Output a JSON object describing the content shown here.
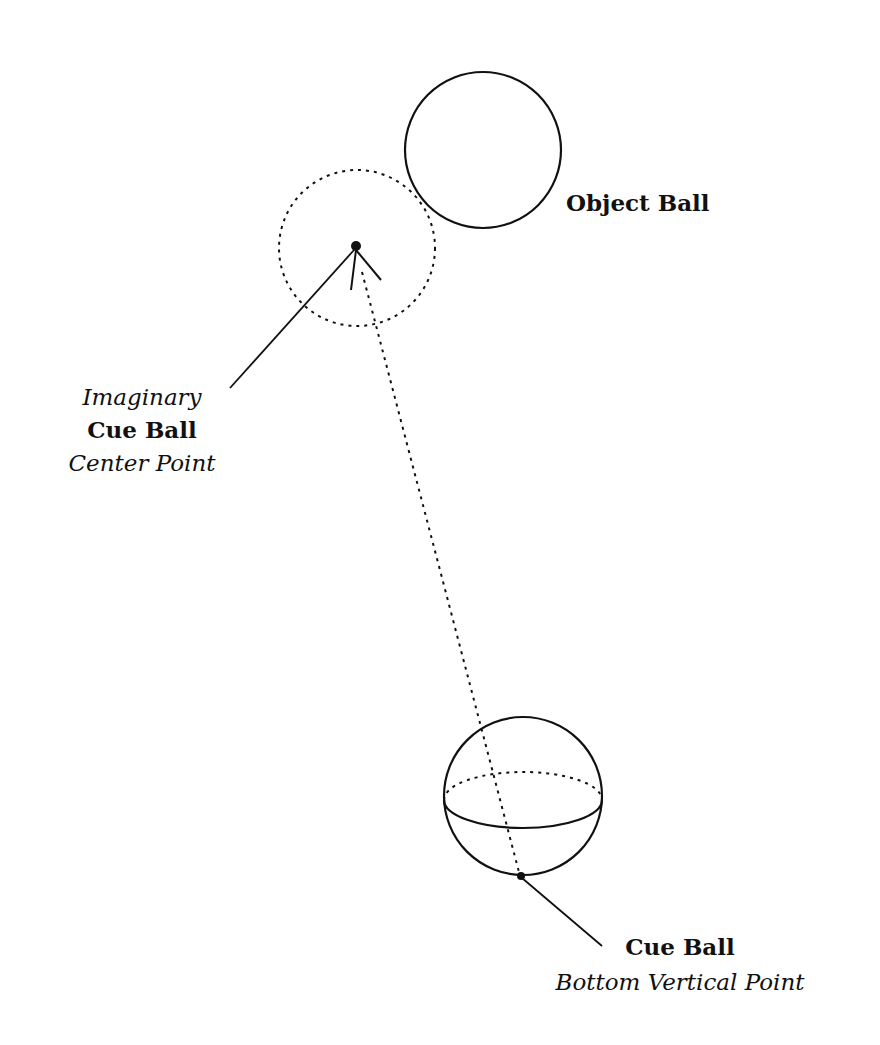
{
  "diagram": {
    "labels": {
      "object_ball": "Object Ball",
      "imaginary_line1": "Imaginary",
      "imaginary_line2": "Cue Ball",
      "imaginary_line3": "Center Point",
      "cue_ball_line1": "Cue Ball",
      "cue_ball_line2": "Bottom Vertical Point"
    },
    "colors": {
      "stroke": "#111111",
      "background": "#ffffff"
    }
  }
}
